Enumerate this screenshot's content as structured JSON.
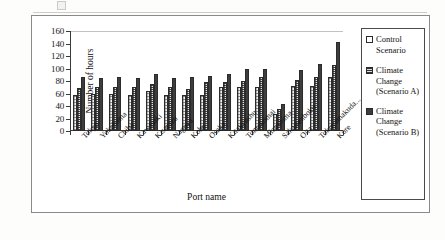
{
  "chart_data": {
    "type": "bar",
    "title": "",
    "xlabel": "Port name",
    "ylabel": "Number of hours",
    "ylim": [
      0,
      160
    ],
    "yticks": [
      0,
      20,
      40,
      60,
      80,
      100,
      120,
      140,
      160
    ],
    "grid": false,
    "legend_position": "right",
    "categories": [
      "Tokyo",
      "Yokohama",
      "Chiba",
      "Kawasaki",
      "Kisarazu",
      "Nagoya",
      "Kobe",
      "Osaka",
      "Kitakyushu",
      "Tomakomai",
      "Mizushima",
      "Sakaisenboku",
      "Oita",
      "Tokuyamakuda...",
      "Kure"
    ],
    "series": [
      {
        "name": "Control Scenario",
        "values": [
          58,
          59,
          60,
          58,
          64,
          57,
          57,
          58,
          70,
          71,
          70,
          28,
          72,
          72,
          87
        ]
      },
      {
        "name": "Climate Change (Scenario A)",
        "values": [
          69,
          70,
          70,
          70,
          75,
          70,
          67,
          78,
          79,
          80,
          87,
          36,
          82,
          87,
          106
        ]
      },
      {
        "name": "Climate Change (Scenario B)",
        "values": [
          86,
          85,
          86,
          85,
          91,
          85,
          87,
          88,
          91,
          99,
          99,
          44,
          98,
          108,
          142
        ]
      }
    ]
  },
  "legend": {
    "items": [
      {
        "label": "Control Scenario",
        "swatch": "open-square-icon",
        "color": "#ffffff"
      },
      {
        "label": "Climate Change (Scenario A)",
        "swatch": "hatched-square-icon",
        "color": "#dcdcdc"
      },
      {
        "label": "Climate Change (Scenario B)",
        "swatch": "filled-square-icon",
        "color": "#3d3d3d"
      }
    ]
  }
}
